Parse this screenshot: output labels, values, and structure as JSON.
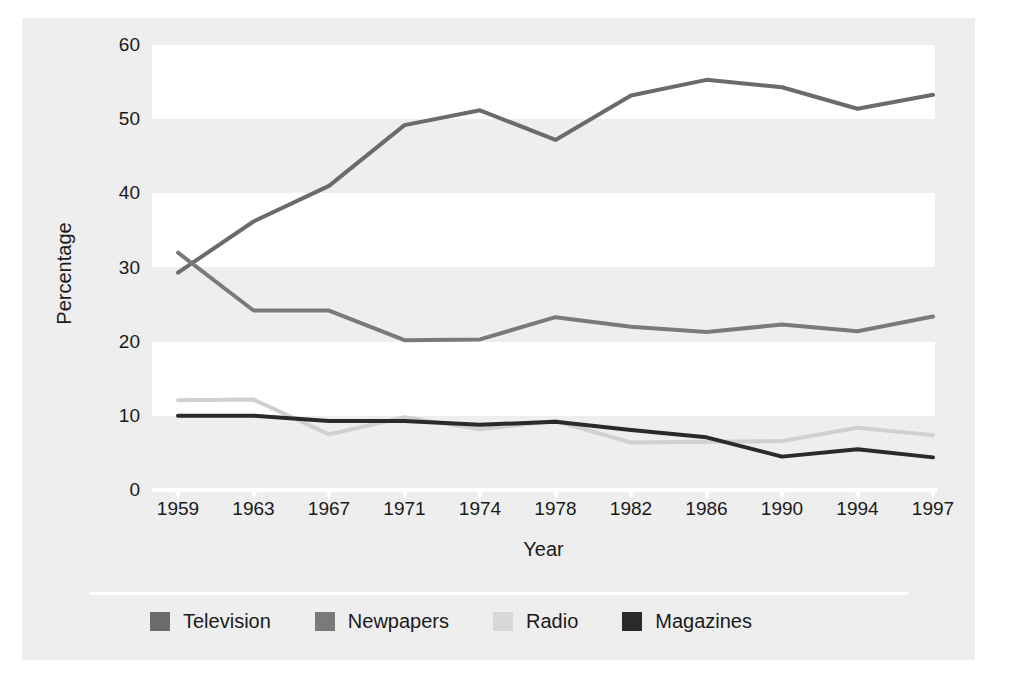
{
  "chart_data": {
    "type": "line",
    "title": "",
    "xlabel": "Year",
    "ylabel": "Percentage",
    "categories": [
      "1959",
      "1963",
      "1967",
      "1971",
      "1974",
      "1978",
      "1982",
      "1986",
      "1990",
      "1994",
      "1997"
    ],
    "x": [
      1959,
      1963,
      1967,
      1971,
      1974,
      1978,
      1982,
      1986,
      1990,
      1994,
      1997
    ],
    "ylim": [
      0,
      60
    ],
    "yticks": [
      0,
      10,
      20,
      30,
      40,
      50,
      60
    ],
    "ytick_labels": [
      "0",
      "10",
      "20",
      "30",
      "40",
      "50",
      "60"
    ],
    "grid": false,
    "banded_background": true,
    "legend_position": "bottom",
    "series": [
      {
        "name": "Television",
        "color": "#6b6b6b",
        "values": [
          29.3,
          36.2,
          41.0,
          49.2,
          51.2,
          47.2,
          53.2,
          55.3,
          54.3,
          51.4,
          53.3
        ]
      },
      {
        "name": "Newpapers",
        "color": "#7a7a7a",
        "values": [
          32.0,
          24.2,
          24.2,
          20.2,
          20.3,
          23.3,
          22.0,
          21.3,
          22.3,
          21.4,
          23.4
        ]
      },
      {
        "name": "Radio",
        "color": "#d0d0d0",
        "values": [
          12.1,
          12.2,
          7.5,
          9.8,
          8.2,
          9.3,
          6.4,
          6.5,
          6.6,
          8.4,
          7.4
        ]
      },
      {
        "name": "Magazines",
        "color": "#2a2a2a",
        "values": [
          10.0,
          10.0,
          9.3,
          9.3,
          8.8,
          9.2,
          8.1,
          7.1,
          4.5,
          5.5,
          4.4
        ]
      }
    ]
  },
  "legend": {
    "items": [
      {
        "label": "Television",
        "color": "#6b6b6b"
      },
      {
        "label": "Newpapers",
        "color": "#7a7a7a"
      },
      {
        "label": "Radio",
        "color": "#d8d8d8"
      },
      {
        "label": "Magazines",
        "color": "#2a2a2a"
      }
    ]
  },
  "colors": {
    "page_background": "#ffffff",
    "panel_background": "#eeeeee",
    "band_light": "#ffffff",
    "text": "#1a1a1a",
    "baseline": "#ffffff"
  }
}
